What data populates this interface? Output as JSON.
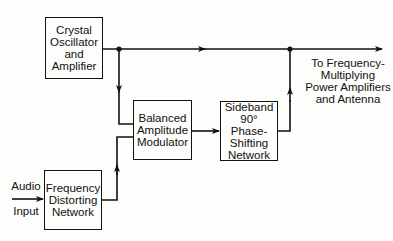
{
  "diagram": {
    "blocks": {
      "crystal": {
        "lines": [
          "Crystal",
          "Oscillator",
          "and",
          "Amplifier"
        ]
      },
      "modulator": {
        "lines": [
          "Balanced",
          "Amplitude",
          "Modulator"
        ]
      },
      "sideband": {
        "lines": [
          "Sideband",
          "90° Phase-",
          "Shifting",
          "Network"
        ]
      },
      "distorting": {
        "lines": [
          "Frequency",
          "Distorting",
          "Network"
        ]
      }
    },
    "labels": {
      "audio_top": "Audio",
      "audio_bottom": "Input",
      "output": [
        "To Frequency-",
        "Multiplying",
        "Power Amplifiers",
        "and Antenna"
      ]
    },
    "connections": [
      {
        "from": "Crystal Oscillator and Amplifier",
        "to": "To Frequency-Multiplying Power Amplifiers and Antenna"
      },
      {
        "from": "Crystal Oscillator and Amplifier",
        "to": "Balanced Amplitude Modulator"
      },
      {
        "from": "Audio Input",
        "to": "Frequency Distorting Network"
      },
      {
        "from": "Frequency Distorting Network",
        "to": "Balanced Amplitude Modulator"
      },
      {
        "from": "Balanced Amplitude Modulator",
        "to": "Sideband 90° Phase-Shifting Network"
      },
      {
        "from": "Sideband 90° Phase-Shifting Network",
        "to": "To Frequency-Multiplying Power Amplifiers and Antenna"
      }
    ],
    "colors": {
      "ink": "#111111",
      "paper": "#fdfdfb"
    }
  }
}
